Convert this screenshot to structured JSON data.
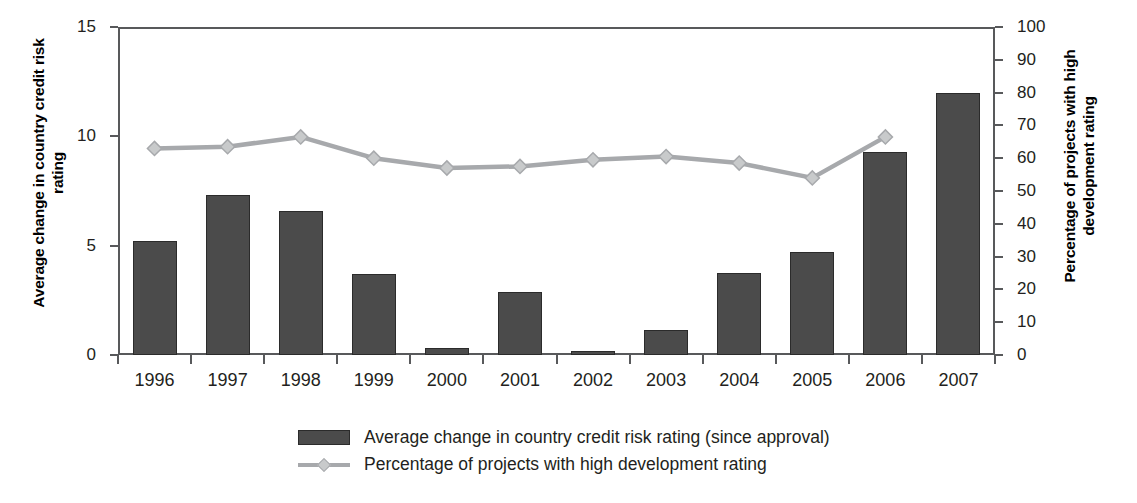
{
  "chart_data": {
    "type": "bar",
    "title": "",
    "categories": [
      "1996",
      "1997",
      "1998",
      "1999",
      "2000",
      "2001",
      "2002",
      "2003",
      "2004",
      "2005",
      "2006",
      "2007"
    ],
    "xlabel": "",
    "ylabel": "Average change in country credit risk rating",
    "ylabel_right": "Percentage of projects with high development rating",
    "ylim": [
      0,
      15
    ],
    "ylim_right": [
      0,
      100
    ],
    "yticks": [
      0,
      5,
      10,
      15
    ],
    "yticks_right": [
      0,
      10,
      20,
      30,
      40,
      50,
      60,
      70,
      80,
      90,
      100
    ],
    "grid": false,
    "legend_position": "bottom",
    "series": [
      {
        "name": "Average change in country credit risk rating (since approval)",
        "type": "bar",
        "axis": "left",
        "color": "#4b4b4b",
        "values": [
          5.2,
          7.3,
          6.6,
          3.7,
          0.3,
          2.9,
          0.2,
          1.15,
          3.75,
          4.7,
          9.3,
          12.0
        ]
      },
      {
        "name": "Percentage of projects with high development rating",
        "type": "line",
        "axis": "right",
        "color": "#a7a9ac",
        "values": [
          63,
          63.5,
          66.5,
          60,
          57,
          57.5,
          59.5,
          60.5,
          58.5,
          54,
          66.5,
          null
        ]
      }
    ]
  },
  "axes": {
    "left_title": "Average change in country credit risk rating",
    "right_title": "Percentage of projects with high development rating",
    "left_tick_labels": [
      "15",
      "10",
      "5",
      "0"
    ],
    "right_tick_labels": [
      "100",
      "90",
      "80",
      "70",
      "60",
      "50",
      "40",
      "30",
      "20",
      "10",
      "0"
    ],
    "x_tick_labels": [
      "1996",
      "1997",
      "1998",
      "1999",
      "2000",
      "2001",
      "2002",
      "2003",
      "2004",
      "2005",
      "2006",
      "2007"
    ]
  },
  "legend": {
    "items": [
      {
        "label": "Average change in country credit risk rating (since approval)",
        "marker": "bar-swatch"
      },
      {
        "label": "Percentage of projects with high development rating",
        "marker": "line-swatch"
      }
    ]
  },
  "colors": {
    "bar": "#4b4b4b",
    "bar_outline": "#2b2b2b",
    "line": "#a7a9ac",
    "marker_fill": "#c8cacb",
    "axis": "#58595b",
    "text": "#231f20",
    "background": "#ffffff"
  }
}
